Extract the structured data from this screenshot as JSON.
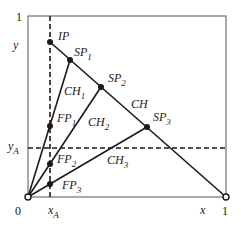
{
  "diagram": {
    "axes": {
      "origin_label": "0",
      "x_end_label": "1",
      "y_end_label": "1",
      "x_axis_label": "x",
      "y_axis_label": "y",
      "xA_label": "x",
      "xA_sub": "A",
      "yA_label": "y",
      "yA_sub": "A"
    },
    "points": {
      "IP": {
        "label": "IP"
      },
      "SP1": {
        "label": "SP",
        "sub": "1"
      },
      "SP2": {
        "label": "SP",
        "sub": "2"
      },
      "SP3": {
        "label": "SP",
        "sub": "3"
      },
      "FP1": {
        "label": "FP",
        "sub": "1"
      },
      "FP2": {
        "label": "FP",
        "sub": "2"
      },
      "FP3": {
        "label": "FP",
        "sub": "3"
      }
    },
    "lines": {
      "CH": {
        "label": "CH"
      },
      "CH1": {
        "label": "CH",
        "sub": "1"
      },
      "CH2": {
        "label": "CH",
        "sub": "2"
      },
      "CH3": {
        "label": "CH",
        "sub": "3"
      }
    },
    "colors": {
      "stroke": "#1a1a1a",
      "frame": "#555555",
      "background": "#ffffff"
    }
  }
}
